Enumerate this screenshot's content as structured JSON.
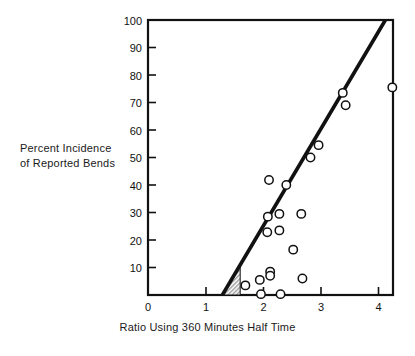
{
  "figure": {
    "width": 415,
    "height": 356,
    "background": "#ffffff",
    "ink_color": "#111111"
  },
  "labels": {
    "ylabel_line1": "Percent Incidence",
    "ylabel_line2": "of Reported Bends",
    "xlabel": "Ratio Using 360 Minutes Half Time"
  },
  "chart_data": {
    "type": "scatter",
    "title": "",
    "xlabel": "Ratio Using 360 Minutes Half Time",
    "ylabel": "Percent Incidence of Reported Bends",
    "xlim": [
      0,
      4.26
    ],
    "ylim": [
      0,
      100
    ],
    "xticks": [
      0,
      1,
      2,
      3,
      4
    ],
    "xtick_labels": [
      "0",
      "1",
      "2",
      "3",
      "4"
    ],
    "yticks": [
      10,
      20,
      30,
      40,
      50,
      60,
      70,
      80,
      90,
      100
    ],
    "ytick_labels": [
      "10",
      "20",
      "30",
      "40",
      "50",
      "60",
      "70",
      "80",
      "90",
      "100"
    ],
    "grid": false,
    "legend": "none",
    "marker": "open-circle",
    "points": [
      {
        "x": 1.69,
        "y": 3.5
      },
      {
        "x": 1.94,
        "y": 5.5
      },
      {
        "x": 1.96,
        "y": 0.3
      },
      {
        "x": 2.08,
        "y": 28.5
      },
      {
        "x": 2.07,
        "y": 22.8
      },
      {
        "x": 2.1,
        "y": 41.8
      },
      {
        "x": 2.12,
        "y": 8.5
      },
      {
        "x": 2.12,
        "y": 7.0
      },
      {
        "x": 2.28,
        "y": 29.5
      },
      {
        "x": 2.28,
        "y": 23.5
      },
      {
        "x": 2.3,
        "y": 0.3
      },
      {
        "x": 2.4,
        "y": 40.0
      },
      {
        "x": 2.52,
        "y": 16.5
      },
      {
        "x": 2.66,
        "y": 29.5
      },
      {
        "x": 2.68,
        "y": 6.0
      },
      {
        "x": 2.82,
        "y": 50.0
      },
      {
        "x": 2.96,
        "y": 54.5
      },
      {
        "x": 3.38,
        "y": 73.5
      },
      {
        "x": 3.43,
        "y": 69.0
      },
      {
        "x": 4.24,
        "y": 75.5
      }
    ],
    "trend_line": {
      "style": "solid-thick",
      "x_start": 1.29,
      "y_start": 0,
      "x_end": 4.12,
      "y_end": 100
    },
    "shaded_region": {
      "fill": "hatched-gray",
      "description": "small shaded triangle at base of trend line",
      "vertices": [
        [
          1.29,
          0
        ],
        [
          1.6,
          0
        ],
        [
          1.6,
          11
        ]
      ]
    }
  }
}
